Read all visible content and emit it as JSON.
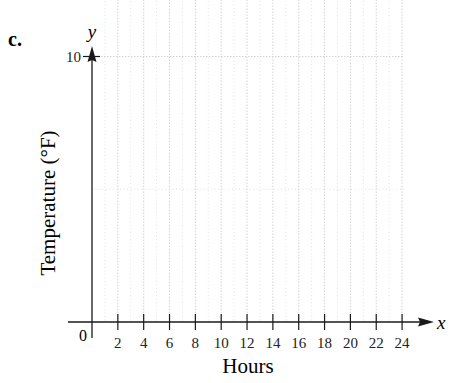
{
  "panel_label": "c.",
  "chart_data": {
    "type": "line",
    "title": "",
    "xlabel": "Hours",
    "ylabel": "Temperature (°F)",
    "x_axis_name": "x",
    "y_axis_name": "y",
    "origin_label": "0",
    "xlim": [
      0,
      24
    ],
    "ylim": [
      0,
      90
    ],
    "xticks": [
      2,
      4,
      6,
      8,
      10,
      12,
      14,
      16,
      18,
      20,
      22,
      24
    ],
    "yticks": [
      10,
      20,
      30,
      40,
      50,
      60,
      70,
      80,
      90
    ],
    "grid": true,
    "legend": null,
    "series": [
      {
        "name": "Temperature",
        "x": [
          0,
          10,
          14,
          24
        ],
        "y": [
          57,
          80,
          60,
          60
        ]
      }
    ]
  },
  "colors": {
    "line": "#7a7a7a",
    "axis": "#1a1a1a",
    "grid": "#cfcfcf",
    "text": "#222222"
  }
}
